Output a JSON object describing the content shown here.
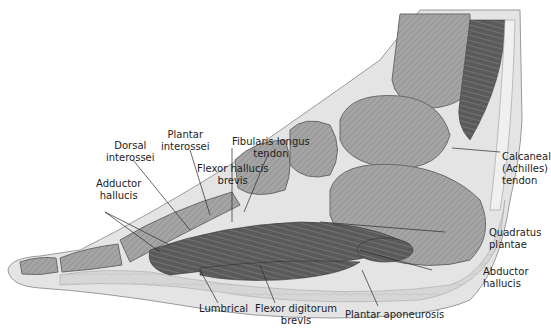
{
  "figure": {
    "labels": [
      {
        "id": "fibularis-longus-tendon",
        "lines": [
          "Fibularis longus",
          "tendon"
        ]
      },
      {
        "id": "flexor-hallucis-brevis",
        "lines": [
          "Flexor hallucis",
          "brevis"
        ]
      },
      {
        "id": "plantar-interossei",
        "lines": [
          "Plantar",
          "interossei"
        ]
      },
      {
        "id": "dorsal-interossei",
        "lines": [
          "Dorsal",
          "interossei"
        ]
      },
      {
        "id": "adductor-hallucis",
        "lines": [
          "Adductor",
          "hallucis"
        ]
      },
      {
        "id": "calcaneal-tendon",
        "lines": [
          "Calcaneal",
          "(Achilles)",
          "tendon"
        ]
      },
      {
        "id": "quadratus-plantae",
        "lines": [
          "Quadratus",
          "plantae"
        ]
      },
      {
        "id": "abductor-hallucis",
        "lines": [
          "Abductor",
          "hallucis"
        ]
      },
      {
        "id": "lumbrical",
        "lines": [
          "Lumbrical"
        ]
      },
      {
        "id": "flexor-digitorum-brevis",
        "lines": [
          "Flexor digitorum",
          "brevis"
        ]
      },
      {
        "id": "plantar-aponeurosis",
        "lines": [
          "Plantar aponeurosis"
        ]
      }
    ]
  },
  "colors": {
    "skin": "#e4e4e4",
    "fat": "#d3d3d3",
    "bone": "#a9a9a9",
    "bone_dark": "#8a8a8a",
    "muscle": "#5e5e5e",
    "tendon": "#f2f2f2",
    "line": "#2a2a2a"
  }
}
